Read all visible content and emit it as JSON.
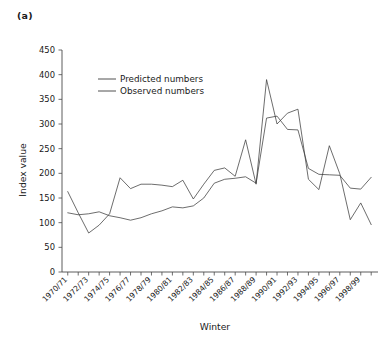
{
  "figure": {
    "panel_label": "(a)"
  },
  "chart_data": {
    "type": "line",
    "title": "(a)",
    "xlabel": "Winter",
    "ylabel": "Index value",
    "ylim": [
      0,
      450
    ],
    "ytick_step": 50,
    "grid": false,
    "legend_position": "upper-left-inside",
    "ytick_labels": [
      "0",
      "50",
      "100",
      "150",
      "200",
      "250",
      "300",
      "350",
      "400",
      "450"
    ],
    "x": [
      "1970/71",
      "1971/72",
      "1972/73",
      "1973/74",
      "1974/75",
      "1975/76",
      "1976/77",
      "1977/78",
      "1978/79",
      "1979/80",
      "1980/81",
      "1981/82",
      "1982/83",
      "1983/84",
      "1984/85",
      "1985/86",
      "1986/87",
      "1987/88",
      "1988/89",
      "1989/90",
      "1990/91",
      "1991/92",
      "1992/93",
      "1993/94",
      "1994/95",
      "1995/96",
      "1996/97",
      "1997/98",
      "1998/99",
      "1999/00"
    ],
    "xtick_labels_shown": [
      "1970/71",
      "1972/73",
      "1974/75",
      "1976/77",
      "1978/79",
      "1980/81",
      "1982/83",
      "1984/85",
      "1986/87",
      "1988/89",
      "1990/91",
      "1992/93",
      "1994/95",
      "1996/97",
      "1998/99"
    ],
    "series": [
      {
        "name": "Predicted numbers",
        "values": [
          120,
          116,
          118,
          122,
          114,
          110,
          105,
          110,
          118,
          124,
          132,
          130,
          134,
          150,
          180,
          188,
          190,
          193,
          180,
          312,
          316,
          289,
          288,
          210,
          198,
          197,
          196,
          170,
          168,
          192
        ]
      },
      {
        "name": "Observed numbers",
        "values": [
          163,
          120,
          79,
          95,
          118,
          191,
          169,
          178,
          178,
          176,
          173,
          186,
          148,
          178,
          206,
          211,
          194,
          268,
          178,
          390,
          300,
          322,
          330,
          188,
          167,
          256,
          199,
          106,
          140,
          96
        ]
      }
    ],
    "legend": [
      "Predicted numbers",
      "Observed numbers"
    ]
  }
}
